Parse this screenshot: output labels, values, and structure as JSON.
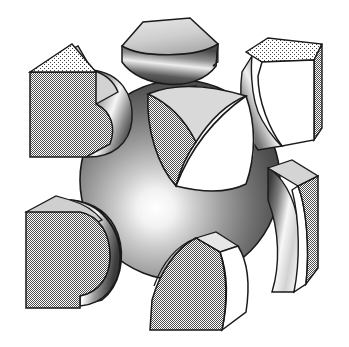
{
  "figure": {
    "name": "unit-cell-exploded-diagram",
    "width": 349,
    "height": 347,
    "background_color": "#ffffff",
    "line_color": "#1a1a1a",
    "style": "halftone-dithered grayscale technical illustration",
    "has_text": false,
    "caption": ""
  },
  "palette": {
    "outline": "#1a1a1a",
    "white_face": "#ffffff",
    "light_gray": "#d8d8d8",
    "mid_gray": "#a8a8a8",
    "dither_gray": "#b4b4b4",
    "dark_gray": "#6e6e6e",
    "darker_gray": "#4a4a4a",
    "shadow": "#2e2e2e",
    "highlight": "#fdfdfd"
  },
  "parts": [
    {
      "id": "central-sphere",
      "label": "Central sphere",
      "shape": "sphere",
      "center": [
        180,
        180
      ],
      "radius": 100,
      "highlight_point": [
        152,
        192
      ],
      "shading": "radial gradient, light from lower-left"
    },
    {
      "id": "core-rounded-cube",
      "label": "Rounded-corner cube core",
      "shape": "spherical-triangle-cube",
      "center": [
        196,
        145
      ],
      "size": 118,
      "faces": [
        "top",
        "left",
        "right"
      ],
      "face_tones": [
        "light_gray",
        "dither_gray",
        "white_face"
      ]
    },
    {
      "id": "corner-top-center",
      "label": "Top center corner segment",
      "shape": "concave-corner-block",
      "position": [
        118,
        12
      ],
      "size": [
        118,
        78
      ],
      "cut": "concave"
    },
    {
      "id": "corner-top-left",
      "label": "Top left corner segment",
      "shape": "concave-corner-block",
      "position": [
        26,
        48
      ],
      "size": [
        108,
        112
      ],
      "cut": "concave"
    },
    {
      "id": "corner-top-right",
      "label": "Top right corner segment",
      "shape": "concave-corner-block",
      "position": [
        238,
        38
      ],
      "size": [
        104,
        118
      ],
      "cut": "concave"
    },
    {
      "id": "corner-bottom-left",
      "label": "Bottom left corner segment",
      "shape": "convex-corner-block",
      "position": [
        24,
        196
      ],
      "size": [
        96,
        112
      ],
      "cut": "convex"
    },
    {
      "id": "corner-bottom-center",
      "label": "Bottom center corner segment",
      "shape": "convex-corner-block",
      "position": [
        140,
        232
      ],
      "size": [
        106,
        104
      ],
      "cut": "convex"
    },
    {
      "id": "corner-bottom-right",
      "label": "Bottom right corner segment",
      "shape": "convex-corner-block",
      "position": [
        262,
        158
      ],
      "size": [
        82,
        132
      ],
      "cut": "convex"
    }
  ]
}
